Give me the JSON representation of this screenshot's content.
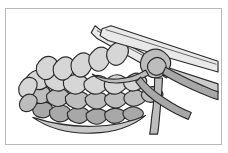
{
  "figure": {
    "frame": {
      "border_color": "#b9b9b9",
      "background_color": "#ffffff",
      "x": 5,
      "y": 8,
      "width": 217,
      "height": 137
    },
    "palette": {
      "outline": "#2b2b2b",
      "yarn_light": "#d6d6d6",
      "yarn_mid": "#bdbdbd",
      "yarn_dark": "#a8a8a8",
      "needle_fill": "#e9e9e9",
      "needle_shadow": "#cccccc",
      "page_background": "#ffffff"
    },
    "objects": [
      {
        "name": "knitted-fabric",
        "description": "Stockinette fabric swatch of interlocking loops, three visible rows, angled from lower-left to upper-right"
      },
      {
        "name": "left-needle",
        "description": "Knitting needle holding live stitches, tip pointing up and to the left"
      },
      {
        "name": "right-needle",
        "description": "Working needle crossing over the left needle, tapered tip pointing up and to the left, shaft extending to the right edge"
      },
      {
        "name": "working-yarn",
        "description": "Strand of yarn wrapped around the right needle and trailing down off the fabric"
      },
      {
        "name": "yarn-tail",
        "description": "Second loose strand of yarn hanging below and to the right"
      }
    ],
    "stitch_counts": {
      "rows": 3,
      "stitches_on_needle": 6
    }
  }
}
